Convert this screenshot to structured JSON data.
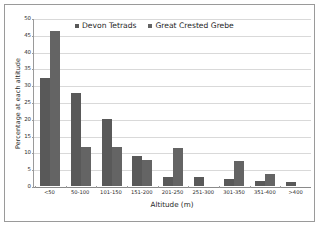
{
  "chart_data": {
    "type": "bar",
    "title": "",
    "xlabel": "Altitude (m)",
    "ylabel": "Percentage at each altitude",
    "categories": [
      "<50",
      "50-100",
      "101-150",
      "151-200",
      "201-250",
      "251-300",
      "301-350",
      "351-400",
      ">400"
    ],
    "series": [
      {
        "name": "Devon Tetrads",
        "color": "#595959",
        "values": [
          32.0,
          27.8,
          19.9,
          9.0,
          2.7,
          2.7,
          2.1,
          1.6,
          1.3
        ]
      },
      {
        "name": "Great Crested Grebe",
        "color": "#646464",
        "values": [
          46.2,
          11.5,
          11.5,
          7.6,
          11.4,
          0,
          7.5,
          3.7,
          0
        ]
      }
    ],
    "ylim": [
      0,
      50
    ],
    "yticks": [
      0,
      5,
      10,
      15,
      20,
      25,
      30,
      35,
      40,
      45,
      50
    ],
    "ytick_labels": [
      "0",
      "5",
      "10",
      "15",
      "20",
      "25",
      "30",
      "35",
      "40",
      "45",
      "50"
    ],
    "grid": true,
    "grid_axis": "y",
    "legend_position": "top-center"
  }
}
